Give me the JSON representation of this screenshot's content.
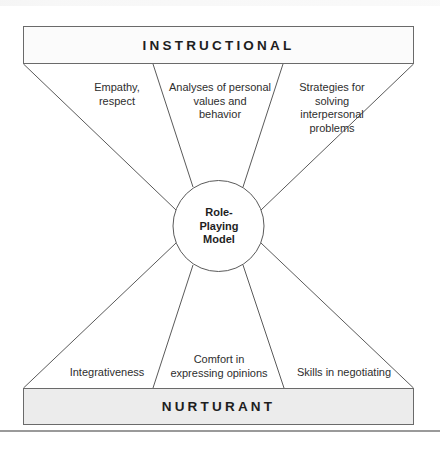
{
  "diagram": {
    "top_box": {
      "title": "INSTRUCTIONAL"
    },
    "bottom_box": {
      "title": "NURTURANT"
    },
    "center": {
      "label": "Role-\nPlaying\nModel"
    },
    "instructional_effects": [
      {
        "label": "Empathy,\nrespect"
      },
      {
        "label": "Analyses of personal\nvalues and\nbehavior"
      },
      {
        "label": "Strategies for\nsolving\ninterpersonal\nproblems"
      }
    ],
    "nurturant_effects": [
      {
        "label": "Integrativeness"
      },
      {
        "label": "Comfort in\nexpressing opinions"
      },
      {
        "label": "Skills in negotiating"
      }
    ],
    "colors": {
      "line": "#5a5a5a",
      "top_fill": "#fbfbfb",
      "bottom_fill": "#ececec",
      "rule": "#9a9a9a"
    }
  }
}
